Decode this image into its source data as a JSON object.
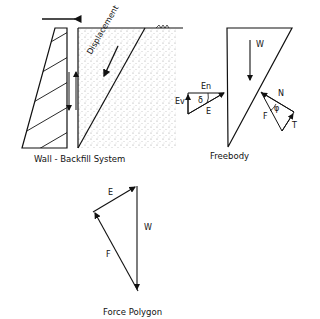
{
  "diagram": {
    "panels": [
      {
        "id": "wall-backfill",
        "caption": "Wall - Backfill System"
      },
      {
        "id": "freebody",
        "caption": "Freebody"
      },
      {
        "id": "force-polygon",
        "caption": "Force Polygon"
      }
    ],
    "labels": {
      "displacement": "Displacement",
      "W": "W",
      "En": "En",
      "Ev": "Ev",
      "delta": "δ",
      "E": "E",
      "N": "N",
      "phi": "φ",
      "F": "F",
      "T": "T",
      "poly_E": "E",
      "poly_W": "W",
      "poly_F": "F"
    },
    "colors": {
      "line": "#111111",
      "background": "#ffffff",
      "stipple": "#9a9a9a"
    }
  }
}
